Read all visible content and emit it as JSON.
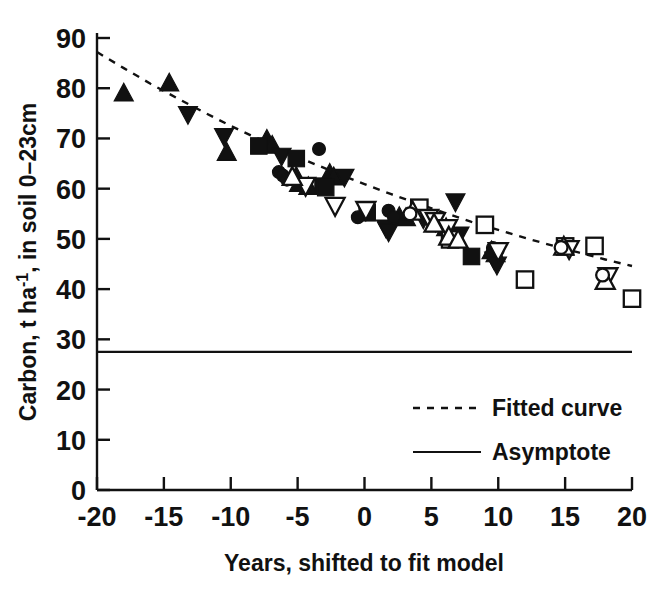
{
  "chart_data": {
    "type": "scatter",
    "title": "",
    "xlabel": "Years, shifted to fit model",
    "ylabel": "Carbon, t ha -1, in soil 0-23cm",
    "xlim": [
      -20,
      20
    ],
    "ylim": [
      0,
      90
    ],
    "xticks": [
      -20,
      -15,
      -10,
      -5,
      0,
      5,
      10,
      15,
      20
    ],
    "xtick_labels": [
      "-20",
      "-15",
      "-10",
      "-5",
      "0",
      "5",
      "10",
      "15",
      "20"
    ],
    "yticks": [
      0,
      10,
      20,
      30,
      40,
      50,
      60,
      70,
      80,
      90
    ],
    "ytick_labels": [
      "0",
      "10",
      "20",
      "30",
      "40",
      "50",
      "60",
      "70",
      "80",
      "90"
    ],
    "grid": false,
    "legend_position": "lower-right",
    "legend": [
      {
        "label": "Fitted curve",
        "style": "dashed-line"
      },
      {
        "label": "Asymptote",
        "style": "solid-line"
      }
    ],
    "asymptote_value": 27.5,
    "fitted_curve": {
      "description": "Exponential decay toward asymptote",
      "x": [
        -20,
        -18,
        -16,
        -14,
        -12,
        -10,
        -8,
        -6,
        -4,
        -2,
        0,
        2,
        4,
        6,
        8,
        10,
        12,
        14,
        16,
        18,
        20
      ],
      "y": [
        87.2,
        84.0,
        80.9,
        78.0,
        75.2,
        72.5,
        70.0,
        67.5,
        65.2,
        63.0,
        60.9,
        58.9,
        57.0,
        55.2,
        53.4,
        51.8,
        50.2,
        48.7,
        47.3,
        45.9,
        44.6
      ]
    },
    "series": [
      {
        "name": "filled-up-triangle",
        "marker": "triangle-up",
        "fill": "solid",
        "points": [
          {
            "x": -18.0,
            "y": 79.0
          },
          {
            "x": -14.6,
            "y": 81.0
          },
          {
            "x": -10.3,
            "y": 67.2
          },
          {
            "x": -7.3,
            "y": 69.8
          },
          {
            "x": -6.9,
            "y": 68.6
          },
          {
            "x": -5.1,
            "y": 62.4
          },
          {
            "x": -4.9,
            "y": 61.0
          },
          {
            "x": -4.2,
            "y": 60.4
          },
          {
            "x": -2.6,
            "y": 63.0
          },
          {
            "x": -2.3,
            "y": 62.3
          },
          {
            "x": 2.6,
            "y": 54.4
          },
          {
            "x": 3.1,
            "y": 54.2
          },
          {
            "x": 5.4,
            "y": 53.0
          },
          {
            "x": 6.1,
            "y": 52.2
          },
          {
            "x": 6.6,
            "y": 51.0
          },
          {
            "x": 9.5,
            "y": 47.6
          },
          {
            "x": 9.8,
            "y": 47.0
          }
        ]
      },
      {
        "name": "filled-down-triangle",
        "marker": "triangle-down",
        "fill": "solid",
        "points": [
          {
            "x": -13.2,
            "y": 74.8
          },
          {
            "x": -10.5,
            "y": 70.4
          },
          {
            "x": -6.2,
            "y": 66.5
          },
          {
            "x": -1.5,
            "y": 62.3
          },
          {
            "x": 1.6,
            "y": 52.2
          },
          {
            "x": 1.8,
            "y": 51.4
          },
          {
            "x": 4.4,
            "y": 54.0
          },
          {
            "x": 6.8,
            "y": 57.4
          },
          {
            "x": 7.1,
            "y": 50.8
          },
          {
            "x": 9.7,
            "y": 45.8
          },
          {
            "x": 9.9,
            "y": 44.8
          }
        ]
      },
      {
        "name": "filled-square",
        "marker": "square",
        "fill": "solid",
        "points": [
          {
            "x": -7.9,
            "y": 68.5
          },
          {
            "x": -5.1,
            "y": 66.0
          },
          {
            "x": -3.1,
            "y": 60.5
          },
          {
            "x": -2.9,
            "y": 60.2
          },
          {
            "x": 0.2,
            "y": 55.2
          },
          {
            "x": 8.0,
            "y": 46.5
          }
        ]
      },
      {
        "name": "filled-circle",
        "marker": "circle",
        "fill": "solid",
        "points": [
          {
            "x": -6.4,
            "y": 63.3
          },
          {
            "x": -6.1,
            "y": 62.6
          },
          {
            "x": -3.4,
            "y": 67.9
          },
          {
            "x": -5.8,
            "y": 61.8
          },
          {
            "x": -0.5,
            "y": 54.3
          },
          {
            "x": 1.8,
            "y": 55.6
          },
          {
            "x": 2.2,
            "y": 54.3
          },
          {
            "x": 9.6,
            "y": 48.2
          }
        ]
      },
      {
        "name": "open-square",
        "marker": "square",
        "fill": "open",
        "points": [
          {
            "x": 4.1,
            "y": 56.2
          },
          {
            "x": 6.4,
            "y": 49.9
          },
          {
            "x": 9.0,
            "y": 52.8
          },
          {
            "x": 12.0,
            "y": 41.9
          },
          {
            "x": 15.0,
            "y": 48.5
          },
          {
            "x": 17.2,
            "y": 48.6
          },
          {
            "x": 20.0,
            "y": 38.1
          }
        ]
      },
      {
        "name": "open-down-triangle",
        "marker": "triangle-down",
        "fill": "open",
        "points": [
          {
            "x": -4.4,
            "y": 60.6
          },
          {
            "x": -2.2,
            "y": 56.6
          },
          {
            "x": 0.1,
            "y": 55.8
          },
          {
            "x": 4.8,
            "y": 54.2
          },
          {
            "x": 5.3,
            "y": 53.6
          },
          {
            "x": 6.2,
            "y": 52.2
          },
          {
            "x": 10.0,
            "y": 47.6
          },
          {
            "x": 15.3,
            "y": 48.0
          },
          {
            "x": 18.2,
            "y": 42.6
          }
        ]
      },
      {
        "name": "open-up-triangle",
        "marker": "triangle-up",
        "fill": "open",
        "points": [
          {
            "x": -5.4,
            "y": 62.3
          },
          {
            "x": 3.6,
            "y": 55.4
          },
          {
            "x": 5.2,
            "y": 53.0
          },
          {
            "x": 6.3,
            "y": 50.4
          },
          {
            "x": 7.0,
            "y": 49.8
          },
          {
            "x": 14.9,
            "y": 48.4
          },
          {
            "x": 18.0,
            "y": 41.6
          }
        ]
      },
      {
        "name": "open-circle",
        "marker": "circle",
        "fill": "open",
        "points": [
          {
            "x": 3.4,
            "y": 55.0
          },
          {
            "x": 14.7,
            "y": 48.3
          },
          {
            "x": 17.8,
            "y": 42.8
          }
        ]
      }
    ]
  }
}
